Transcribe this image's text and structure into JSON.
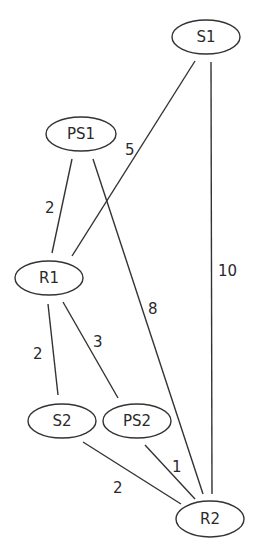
{
  "diagram": {
    "type": "weighted-graph",
    "nodes": [
      {
        "id": "S1",
        "label": "S1",
        "cx": 206,
        "cy": 37,
        "rx": 34,
        "ry": 17
      },
      {
        "id": "PS1",
        "label": "PS1",
        "cx": 81,
        "cy": 134,
        "rx": 35,
        "ry": 17
      },
      {
        "id": "R1",
        "label": "R1",
        "cx": 49,
        "cy": 278,
        "rx": 34,
        "ry": 17
      },
      {
        "id": "S2",
        "label": "S2",
        "cx": 62,
        "cy": 421,
        "rx": 34,
        "ry": 17
      },
      {
        "id": "PS2",
        "label": "PS2",
        "cx": 137,
        "cy": 421,
        "rx": 34,
        "ry": 17
      },
      {
        "id": "R2",
        "label": "R2",
        "cx": 210,
        "cy": 519,
        "rx": 34,
        "ry": 18
      }
    ],
    "edges": [
      {
        "from": "S1",
        "to": "R1",
        "weight": "5",
        "x1": 195,
        "y1": 61,
        "x2": 72,
        "y2": 256,
        "lx": 125,
        "ly": 155
      },
      {
        "from": "S1",
        "to": "R2",
        "weight": "10",
        "x1": 211,
        "y1": 62,
        "x2": 212,
        "y2": 494,
        "lx": 218,
        "ly": 276
      },
      {
        "from": "PS1",
        "to": "R1",
        "weight": "2",
        "x1": 72,
        "y1": 159,
        "x2": 52,
        "y2": 253,
        "lx": 45,
        "ly": 213
      },
      {
        "from": "PS1",
        "to": "R2",
        "weight": "8",
        "x1": 93,
        "y1": 159,
        "x2": 203,
        "y2": 494,
        "lx": 148,
        "ly": 314
      },
      {
        "from": "R1",
        "to": "S2",
        "weight": "2",
        "x1": 48,
        "y1": 304,
        "x2": 58,
        "y2": 395,
        "lx": 33,
        "ly": 359
      },
      {
        "from": "R1",
        "to": "PS2",
        "weight": "3",
        "x1": 63,
        "y1": 302,
        "x2": 118,
        "y2": 398,
        "lx": 93,
        "ly": 347
      },
      {
        "from": "S2",
        "to": "R2",
        "weight": "2",
        "x1": 83,
        "y1": 442,
        "x2": 181,
        "y2": 504,
        "lx": 113,
        "ly": 493
      },
      {
        "from": "PS2",
        "to": "R2",
        "weight": "1",
        "x1": 145,
        "y1": 445,
        "x2": 195,
        "y2": 499,
        "lx": 172,
        "ly": 472
      }
    ]
  }
}
